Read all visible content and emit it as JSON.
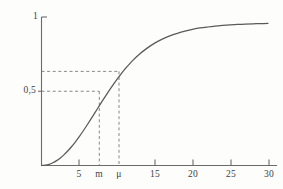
{
  "figure": {
    "title": "",
    "background_color": "#fdfdfc",
    "line_color": "#5a5a5a",
    "axis_color": "#6b6b6b",
    "dash_color": "#7a7a7a",
    "text_color": "#3f3f3f"
  },
  "chart_data": {
    "type": "line",
    "title": "",
    "xlabel": "",
    "ylabel": "",
    "xlim": [
      0,
      31.2
    ],
    "ylim": [
      0,
      1.04
    ],
    "grid": false,
    "legend": null,
    "x_ticks": [
      {
        "value": 5,
        "label": "5"
      },
      {
        "value": 7.6,
        "label": "m"
      },
      {
        "value": 10.2,
        "label": "μ"
      },
      {
        "value": 15,
        "label": "15"
      },
      {
        "value": 20,
        "label": "20"
      },
      {
        "value": 25,
        "label": "25"
      },
      {
        "value": 30,
        "label": "30"
      }
    ],
    "y_ticks": [
      {
        "value": 0.5,
        "label": "0,5"
      },
      {
        "value": 1.0,
        "label": "1"
      }
    ],
    "series": [
      {
        "name": "cumulative distribution function",
        "x": [
          0,
          0.5,
          1,
          1.5,
          2,
          2.5,
          3,
          3.5,
          4,
          4.5,
          5,
          5.5,
          6,
          6.5,
          7,
          7.5,
          8,
          8.5,
          9,
          9.5,
          10,
          10.5,
          11,
          12,
          13,
          14,
          15,
          16,
          17,
          18,
          19,
          20,
          21,
          22,
          23,
          24,
          25,
          26,
          27,
          28,
          29,
          30
        ],
        "y": [
          0,
          0.002,
          0.008,
          0.019,
          0.034,
          0.053,
          0.076,
          0.103,
          0.133,
          0.166,
          0.202,
          0.24,
          0.28,
          0.321,
          0.363,
          0.405,
          0.447,
          0.488,
          0.528,
          0.567,
          0.604,
          0.639,
          0.672,
          0.731,
          0.781,
          0.822,
          0.857,
          0.885,
          0.908,
          0.926,
          0.941,
          0.953,
          0.963,
          0.97,
          0.976,
          0.981,
          0.985,
          0.988,
          0.99,
          0.992,
          0.994,
          0.995
        ]
      }
    ],
    "annotations": [
      {
        "name": "median",
        "label": "m",
        "x": 7.6,
        "y": 0.5,
        "guide": "dashed horizontal from y-axis to curve, dashed vertical from curve to x-axis"
      },
      {
        "name": "mean",
        "label": "μ",
        "x": 10.2,
        "y": 0.632,
        "guide": "dashed horizontal from y-axis to curve, dashed vertical from curve to x-axis"
      }
    ]
  },
  "labels": {
    "y_top": "1",
    "y_half": "0,5",
    "x_5": "5",
    "x_m": "m",
    "x_mu": "μ",
    "x_15": "15",
    "x_20": "20",
    "x_25": "25",
    "x_30": "30"
  }
}
